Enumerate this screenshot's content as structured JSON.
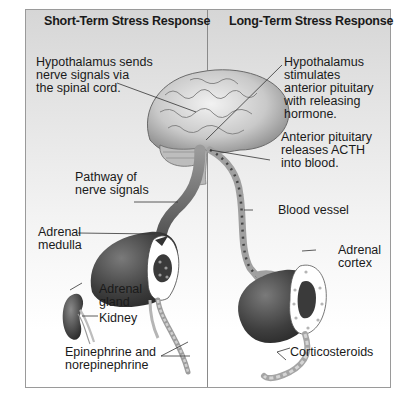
{
  "panels": [
    {
      "title": "Short-Term Stress Response",
      "labels": {
        "hypothalamus": "Hypothalamus sends\nnerve signals via\nthe spinal cord.",
        "pathway": "Pathway of\nnerve signals",
        "adrenal_medulla": "Adrenal\nmedulla",
        "adrenal_gland": "Adrenal\ngland",
        "kidney": "Kidney",
        "epinephrine": "Epinephrine and\nnorepinephrine"
      }
    },
    {
      "title": "Long-Term Stress Response",
      "labels": {
        "hypothalamus": "Hypothalamus\nstimulates\nanterior pituitary\nwith releasing\nhormone.",
        "anterior_pituitary": "Anterior pituitary\nreleases ACTH\ninto blood.",
        "blood_vessel": "Blood vessel",
        "adrenal_cortex": "Adrenal\ncortex",
        "corticosteroids": "Corticosteroids"
      }
    }
  ],
  "colors": {
    "panel_border": "#9a9a9a",
    "background_top": "#d6d6d6",
    "background_bottom": "#ffffff",
    "organ_dark": "#3a3a3a",
    "vessel": "#9c9c9c",
    "text": "#1a1a1a"
  }
}
